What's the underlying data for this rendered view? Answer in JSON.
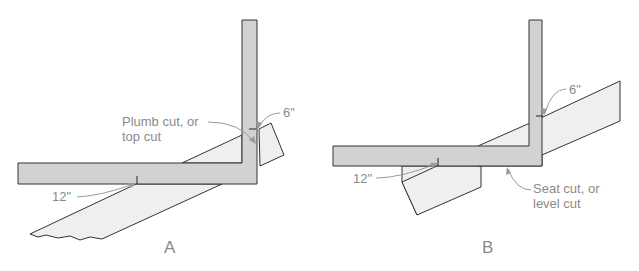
{
  "figure": {
    "panels": [
      {
        "id": "A",
        "caption": "A",
        "labels": {
          "cut": [
            "Plumb cut, or",
            "top cut"
          ],
          "rise": "6\"",
          "run": "12\""
        }
      },
      {
        "id": "B",
        "caption": "B",
        "labels": {
          "cut": [
            "Seat cut, or",
            "level cut"
          ],
          "rise": "6\"",
          "run": "12\""
        }
      }
    ],
    "colors": {
      "square_fill": "#d2d2d2",
      "rafter_fill": "#efefef",
      "outline": "#333333",
      "label_text": "#8a8a8a"
    }
  }
}
